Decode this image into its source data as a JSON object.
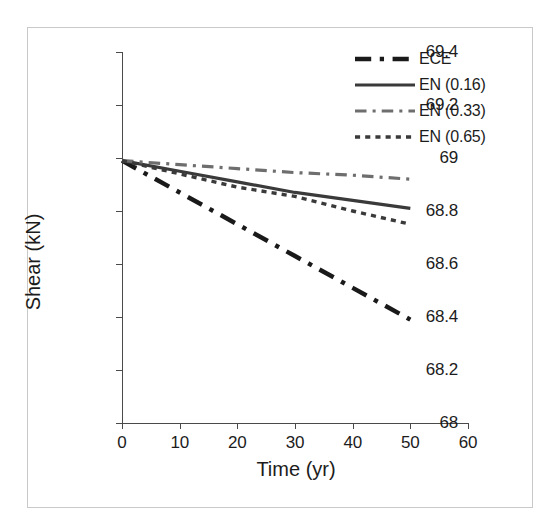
{
  "chart_data": {
    "type": "line",
    "title": "",
    "xlabel": "Time (yr)",
    "ylabel": "Shear (kN)",
    "xlim": [
      0,
      60
    ],
    "ylim": [
      68,
      69.4
    ],
    "xticks": [
      0,
      10,
      20,
      30,
      40,
      50,
      60
    ],
    "xtick_labels": [
      "0",
      "10",
      "20",
      "30",
      "40",
      "50",
      "60"
    ],
    "yticks": [
      68,
      68.2,
      68.4,
      68.6,
      68.8,
      69,
      69.2,
      69.4
    ],
    "ytick_labels": [
      "68",
      "68.2",
      "68.4",
      "68.6",
      "68.8",
      "69",
      "69.2",
      "69.4"
    ],
    "grid": false,
    "legend_position": "top-right",
    "x": [
      0,
      10,
      20,
      30,
      40,
      50
    ],
    "series": [
      {
        "name": "ECE",
        "label": "ECE",
        "values": [
          68.99,
          68.87,
          68.75,
          68.63,
          68.51,
          68.39
        ],
        "color": "#1a1a1a",
        "style": "dash-dot",
        "width": 4.5
      },
      {
        "name": "EN (0.16)",
        "label": "EN (0.16)",
        "values": [
          68.99,
          68.95,
          68.91,
          68.87,
          68.84,
          68.81
        ],
        "color": "#3a3a3a",
        "style": "solid",
        "width": 3.2
      },
      {
        "name": "EN (0.33)",
        "label": "EN (0.33)",
        "values": [
          68.99,
          68.975,
          68.96,
          68.945,
          68.935,
          68.92
        ],
        "color": "#6e6e6e",
        "style": "dash-dot",
        "width": 3.2
      },
      {
        "name": "EN (0.65)",
        "label": "EN (0.65)",
        "values": [
          68.99,
          68.94,
          68.89,
          68.855,
          68.8,
          68.75
        ],
        "color": "#3a3a3a",
        "style": "dotted",
        "width": 3.4
      }
    ]
  },
  "legend": {
    "items": [
      {
        "label": "ECE",
        "swatch": "dash-dot-thick-black"
      },
      {
        "label": "EN (0.16)",
        "swatch": "solid-thick-darkgray"
      },
      {
        "label": "EN (0.33)",
        "swatch": "dash-dot-gray"
      },
      {
        "label": "EN (0.65)",
        "swatch": "dotted-darkgray"
      }
    ]
  },
  "colors": {
    "ece": "#1a1a1a",
    "en016": "#3a3a3a",
    "en033": "#6e6e6e",
    "en065": "#3a3a3a",
    "axis": "#4a4a4a",
    "text": "#1c1c1c",
    "frame": "#c9c9c9",
    "background": "#ffffff"
  }
}
